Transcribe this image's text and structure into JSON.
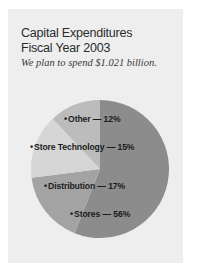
{
  "figure": {
    "title_line_1": "Capital Expenditures",
    "title_line_2": "Fiscal Year 2003",
    "subtitle": "We plan to spend $1.021 billion."
  },
  "labels": {
    "bullet": "•",
    "other": "Other — 12%",
    "store_technology": "Store Technology — 15%",
    "distribution": "Distribution — 17%",
    "stores": "Stores — 56%"
  },
  "chart_data": {
    "type": "pie",
    "title": "Capital Expenditures Fiscal Year 2003",
    "subtitle": "We plan to spend $1.021 billion.",
    "categories": [
      "Stores",
      "Distribution",
      "Store Technology",
      "Other"
    ],
    "values": [
      56,
      17,
      15,
      12
    ],
    "unit": "percent",
    "total": 100,
    "total_label": "$1.021 billion",
    "legend": "inside-slices",
    "grid": false,
    "start_angle_deg": 0,
    "direction": "counterclockwise",
    "colors": {
      "stores": "#8c8c8c",
      "distribution": "#a3a3a3",
      "store_technology": "#d6d6d6",
      "other": "#bcbcbc",
      "card_background": "#eeeeee",
      "page_background": "#ffffff",
      "text": "#2b2b2b",
      "label_text": "#1b1b1b"
    },
    "slices": [
      {
        "name": "Stores",
        "value": 56,
        "color": "#8c8c8c"
      },
      {
        "name": "Distribution",
        "value": 17,
        "color": "#a3a3a3"
      },
      {
        "name": "Store Technology",
        "value": 15,
        "color": "#d6d6d6"
      },
      {
        "name": "Other",
        "value": 12,
        "color": "#bcbcbc"
      }
    ]
  }
}
